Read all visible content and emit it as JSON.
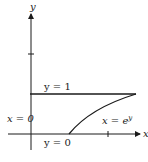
{
  "diagram": {
    "axes": {
      "x_label": "x",
      "y_label": "y"
    },
    "labels": {
      "top_line": "y = 1",
      "left_line": "x = 0",
      "bottom_line": "y = 0",
      "curve": "x = e",
      "curve_exp": "y"
    },
    "colors": {
      "stroke": "#1a1a1a",
      "background": "#ffffff"
    }
  }
}
